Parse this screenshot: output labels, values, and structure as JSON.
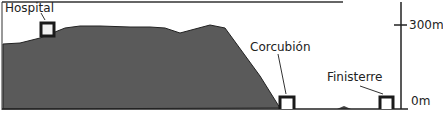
{
  "diagram": {
    "type": "elevation-profile",
    "colors": {
      "terrain": "#5a5a5a",
      "outline": "#1a1a1a",
      "background": "#ffffff",
      "text": "#222222"
    },
    "labels": {
      "hospital": "Hospital",
      "corcubion": "Corcubión",
      "finisterre": "Finisterre"
    },
    "axis": {
      "top_label": "300m",
      "bottom_label": "0m"
    }
  }
}
